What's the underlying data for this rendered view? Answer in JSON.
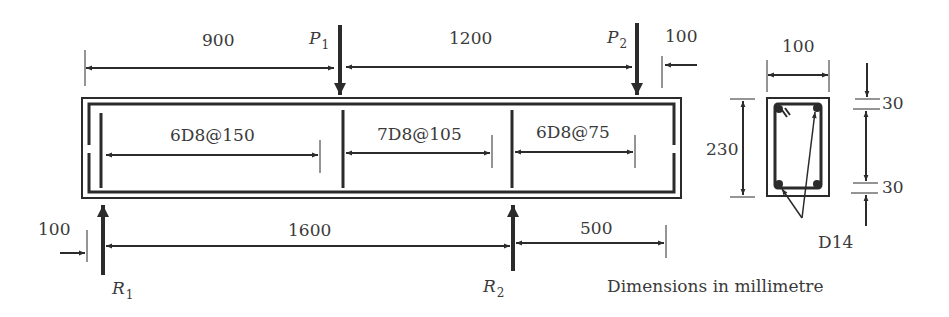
{
  "beam": {
    "loads": [
      {
        "symbol": "P",
        "subscript": "1"
      },
      {
        "symbol": "P",
        "subscript": "2"
      }
    ],
    "reactions": [
      {
        "symbol": "R",
        "subscript": "1"
      },
      {
        "symbol": "R",
        "subscript": "2"
      }
    ],
    "top_dimensions": [
      "900",
      "1200",
      "100"
    ],
    "bottom_dimensions": [
      "100",
      "1600",
      "500"
    ],
    "stirrup_zones": [
      "6D8@150",
      "7D8@105",
      "6D8@75"
    ]
  },
  "section": {
    "width": "100",
    "height": "230",
    "cover_top": "30",
    "cover_bottom": "30",
    "bar_label": "D14"
  },
  "note": "Dimensions in millimetre",
  "colors": {
    "line": "#2b2b2b",
    "text": "#3a3a3a",
    "background": "#ffffff"
  }
}
